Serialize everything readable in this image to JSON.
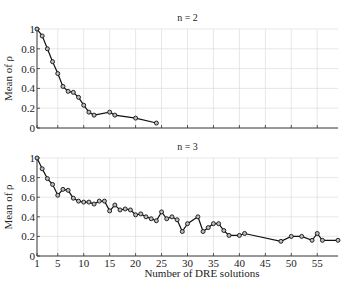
{
  "chart_data": [
    {
      "type": "line",
      "title": "n = 2",
      "xlabel": "",
      "ylabel": "Mean of ρ",
      "xlim": [
        1,
        59
      ],
      "ylim": [
        0,
        1
      ],
      "yticks": [
        0,
        0.2,
        0.4,
        0.6,
        0.8,
        1
      ],
      "ytick_labels": [
        "0",
        "0.2",
        "0.4",
        "0.6",
        "0.8",
        "1"
      ],
      "xticks": [
        1,
        5,
        10,
        15,
        20,
        25,
        30,
        35,
        40,
        45,
        50,
        55
      ],
      "xtick_labels_shown": false,
      "grid": true,
      "marker": "circle",
      "series": [
        {
          "name": "n = 2",
          "x": [
            1,
            2,
            3,
            4,
            5,
            6,
            7,
            8,
            9,
            10,
            11,
            12,
            15,
            16,
            20,
            24
          ],
          "values": [
            1.0,
            0.93,
            0.8,
            0.67,
            0.55,
            0.42,
            0.37,
            0.36,
            0.31,
            0.23,
            0.16,
            0.13,
            0.16,
            0.13,
            0.1,
            0.05
          ]
        }
      ]
    },
    {
      "type": "line",
      "title": "n = 3",
      "xlabel": "Number of DRE solutions",
      "ylabel": "Mean of ρ",
      "xlim": [
        1,
        59
      ],
      "ylim": [
        0,
        1
      ],
      "yticks": [
        0,
        0.2,
        0.4,
        0.6,
        0.8,
        1
      ],
      "ytick_labels": [
        "0",
        "0.2",
        "0.4",
        "0.6",
        "0.8",
        "1"
      ],
      "xticks": [
        1,
        5,
        10,
        15,
        20,
        25,
        30,
        35,
        40,
        45,
        50,
        55
      ],
      "xtick_labels": [
        "1",
        "5",
        "10",
        "15",
        "20",
        "25",
        "30",
        "35",
        "40",
        "45",
        "50",
        "55"
      ],
      "grid": true,
      "marker": "circle",
      "series": [
        {
          "name": "n = 3",
          "x": [
            1,
            2,
            3,
            4,
            5,
            6,
            7,
            8,
            9,
            10,
            11,
            12,
            13,
            14,
            15,
            16,
            17,
            18,
            19,
            20,
            21,
            22,
            23,
            24,
            25,
            26,
            27,
            28,
            29,
            30,
            32,
            33,
            34,
            35,
            36,
            37,
            38,
            40,
            41,
            48,
            50,
            52,
            54,
            55,
            56,
            59
          ],
          "values": [
            1.0,
            0.89,
            0.79,
            0.73,
            0.62,
            0.68,
            0.67,
            0.59,
            0.56,
            0.55,
            0.55,
            0.53,
            0.56,
            0.56,
            0.46,
            0.52,
            0.47,
            0.48,
            0.47,
            0.42,
            0.43,
            0.4,
            0.38,
            0.36,
            0.45,
            0.38,
            0.4,
            0.37,
            0.25,
            0.33,
            0.4,
            0.25,
            0.29,
            0.33,
            0.33,
            0.26,
            0.21,
            0.21,
            0.23,
            0.15,
            0.2,
            0.2,
            0.16,
            0.23,
            0.16,
            0.16
          ]
        }
      ]
    }
  ]
}
